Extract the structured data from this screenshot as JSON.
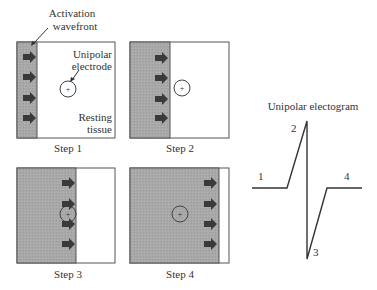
{
  "annotations": {
    "wavefront_line1": "Activation",
    "wavefront_line2": "wavefront",
    "electrode_line1": "Unipolar",
    "electrode_line2": "electrode",
    "tissue_line1": "Resting",
    "tissue_line2": "tissue"
  },
  "steps": [
    {
      "label": "Step 1"
    },
    {
      "label": "Step 2"
    },
    {
      "label": "Step 3"
    },
    {
      "label": "Step 4"
    }
  ],
  "electrogram": {
    "title": "Unipolar electogram",
    "points": [
      {
        "label": "1"
      },
      {
        "label": "2"
      },
      {
        "label": "3"
      },
      {
        "label": "4"
      }
    ]
  },
  "colors": {
    "activated": "#a9a9a9",
    "resting": "#ffffff",
    "arrow": "#3a3a3a",
    "border": "#555555"
  }
}
